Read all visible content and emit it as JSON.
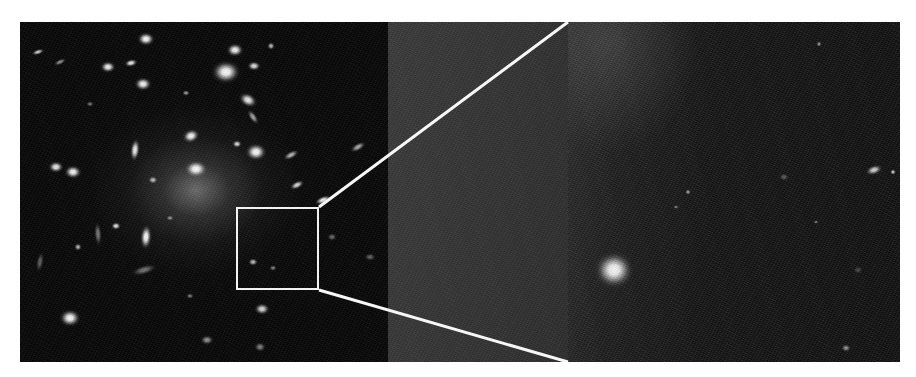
{
  "figure": {
    "kind": "astronomical-image-plate",
    "background_color": "#ffffff",
    "plate_color": "#050505",
    "panels": [
      {
        "id": "wide",
        "name": "wide-cluster-field",
        "description": "Wide-field view of a rich galaxy cluster dominated by a central bright elliptical galaxy with an extended diffuse halo",
        "x": 0,
        "y": 0,
        "width": 368,
        "height": 340,
        "mean_level": "#070707"
      },
      {
        "id": "mid",
        "name": "zoom-wedge-panel",
        "description": "Uniform mid-grey wedge panel bridging the survey box and the magnified cutout",
        "x": 368,
        "y": 0,
        "width": 180,
        "height": 340,
        "mean_level": "#343434"
      },
      {
        "id": "zoom",
        "name": "magnified-cutout-panel",
        "description": "Magnified cutout of the boxed region showing two faint circled sources, one bright saturated star and two galaxies at the right edge",
        "x": 548,
        "y": 0,
        "width": 332,
        "height": 340,
        "mean_level": "#131313"
      }
    ],
    "zoom_box": {
      "name": "survey-region-box",
      "x": 216,
      "y": 185,
      "width": 83,
      "height": 83,
      "stroke_color": "#f2f2f2",
      "stroke_width": 2
    },
    "guide_lines": {
      "name": "magnification-guide-lines",
      "stroke_color": "#f7f7f7",
      "stroke_width": 3,
      "lines": [
        {
          "x1": 299,
          "y1": 185,
          "x2": 548,
          "y2": 0
        },
        {
          "x1": 299,
          "y1": 268,
          "x2": 548,
          "y2": 340
        }
      ]
    },
    "markers": [
      {
        "name": "circled-source-upper",
        "cx": 725,
        "cy": 96,
        "r": 17,
        "stroke_color": "rgba(186,186,186,0.40)"
      },
      {
        "name": "circled-source-lower",
        "cx": 703,
        "cy": 233,
        "r": 17,
        "stroke_color": "rgba(186,186,186,0.40)"
      }
    ],
    "sources_wide": [
      {
        "cx": 18,
        "cy": 30,
        "rx": 7,
        "ry": 3,
        "rot": -18,
        "peak": 0.8
      },
      {
        "cx": 126,
        "cy": 17,
        "rx": 9,
        "ry": 7,
        "rot": 0,
        "peak": 1.0
      },
      {
        "cx": 111,
        "cy": 41,
        "rx": 7,
        "ry": 4,
        "rot": -12,
        "peak": 0.92
      },
      {
        "cx": 215,
        "cy": 28,
        "rx": 9,
        "ry": 7,
        "rot": 0,
        "peak": 0.96
      },
      {
        "cx": 206,
        "cy": 50,
        "rx": 15,
        "ry": 12,
        "rot": 0,
        "peak": 1.0
      },
      {
        "cx": 234,
        "cy": 44,
        "rx": 7,
        "ry": 5,
        "rot": 0,
        "peak": 0.88
      },
      {
        "cx": 251,
        "cy": 24,
        "rx": 4,
        "ry": 4,
        "rot": 0,
        "peak": 0.72
      },
      {
        "cx": 88,
        "cy": 45,
        "rx": 8,
        "ry": 6,
        "rot": 0,
        "peak": 0.95
      },
      {
        "cx": 123,
        "cy": 62,
        "rx": 9,
        "ry": 7,
        "rot": 0,
        "peak": 0.97
      },
      {
        "cx": 40,
        "cy": 40,
        "rx": 7,
        "ry": 3,
        "rot": -25,
        "peak": 0.55
      },
      {
        "cx": 166,
        "cy": 71,
        "rx": 4,
        "ry": 3,
        "rot": 0,
        "peak": 0.6
      },
      {
        "cx": 228,
        "cy": 78,
        "rx": 10,
        "ry": 7,
        "rot": 28,
        "peak": 0.92
      },
      {
        "cx": 233,
        "cy": 95,
        "rx": 9,
        "ry": 4,
        "rot": 55,
        "peak": 0.62
      },
      {
        "cx": 171,
        "cy": 114,
        "rx": 9,
        "ry": 7,
        "rot": -20,
        "peak": 0.98
      },
      {
        "cx": 115,
        "cy": 128,
        "rx": 5,
        "ry": 12,
        "rot": 6,
        "peak": 0.95
      },
      {
        "cx": 217,
        "cy": 122,
        "rx": 5,
        "ry": 4,
        "rot": 0,
        "peak": 0.85
      },
      {
        "cx": 236,
        "cy": 130,
        "rx": 11,
        "ry": 9,
        "rot": 0,
        "peak": 1.0
      },
      {
        "cx": 176,
        "cy": 147,
        "rx": 12,
        "ry": 9,
        "rot": 0,
        "peak": 1.0
      },
      {
        "cx": 36,
        "cy": 145,
        "rx": 8,
        "ry": 6,
        "rot": 0,
        "peak": 0.92
      },
      {
        "cx": 53,
        "cy": 150,
        "rx": 9,
        "ry": 7,
        "rot": 0,
        "peak": 0.97
      },
      {
        "cx": 133,
        "cy": 158,
        "rx": 5,
        "ry": 4,
        "rot": 0,
        "peak": 0.7
      },
      {
        "cx": 271,
        "cy": 133,
        "rx": 9,
        "ry": 4,
        "rot": -28,
        "peak": 0.7
      },
      {
        "cx": 277,
        "cy": 163,
        "rx": 8,
        "ry": 4,
        "rot": -26,
        "peak": 0.85
      },
      {
        "cx": 96,
        "cy": 204,
        "rx": 5,
        "ry": 4,
        "rot": 0,
        "peak": 0.9
      },
      {
        "cx": 78,
        "cy": 212,
        "rx": 4,
        "ry": 13,
        "rot": -4,
        "peak": 0.45
      },
      {
        "cx": 58,
        "cy": 225,
        "rx": 4,
        "ry": 4,
        "rot": 0,
        "peak": 0.7
      },
      {
        "cx": 126,
        "cy": 215,
        "rx": 6,
        "ry": 13,
        "rot": 4,
        "peak": 1.0
      },
      {
        "cx": 124,
        "cy": 248,
        "rx": 14,
        "ry": 5,
        "rot": -16,
        "peak": 0.42
      },
      {
        "cx": 50,
        "cy": 296,
        "rx": 11,
        "ry": 9,
        "rot": 0,
        "peak": 1.0
      },
      {
        "cx": 170,
        "cy": 274,
        "rx": 4,
        "ry": 3,
        "rot": 0,
        "peak": 0.45
      },
      {
        "cx": 242,
        "cy": 287,
        "rx": 8,
        "ry": 6,
        "rot": 0,
        "peak": 0.85
      },
      {
        "cx": 253,
        "cy": 246,
        "rx": 4,
        "ry": 3,
        "rot": 0,
        "peak": 0.48
      },
      {
        "cx": 187,
        "cy": 318,
        "rx": 7,
        "ry": 5,
        "rot": 0,
        "peak": 0.55
      },
      {
        "cx": 240,
        "cy": 325,
        "rx": 6,
        "ry": 5,
        "rot": 0,
        "peak": 0.48
      },
      {
        "cx": 20,
        "cy": 240,
        "rx": 4,
        "ry": 11,
        "rot": 10,
        "peak": 0.35
      },
      {
        "cx": 338,
        "cy": 125,
        "rx": 9,
        "ry": 4,
        "rot": -30,
        "peak": 0.66
      },
      {
        "cx": 303,
        "cy": 178,
        "rx": 9,
        "ry": 4,
        "rot": -22,
        "peak": 0.95
      },
      {
        "cx": 312,
        "cy": 215,
        "rx": 5,
        "ry": 4,
        "rot": 0,
        "peak": 0.4
      },
      {
        "cx": 350,
        "cy": 235,
        "rx": 6,
        "ry": 4,
        "rot": 0,
        "peak": 0.36
      },
      {
        "cx": 233,
        "cy": 240,
        "rx": 5,
        "ry": 4,
        "rot": 0,
        "peak": 0.72
      },
      {
        "cx": 70,
        "cy": 82,
        "rx": 4,
        "ry": 3,
        "rot": 0,
        "peak": 0.42
      },
      {
        "cx": 150,
        "cy": 196,
        "rx": 4,
        "ry": 3,
        "rot": 0,
        "peak": 0.5
      }
    ],
    "sources_zoom": [
      {
        "cx": 46,
        "cy": 248,
        "rx": 20,
        "ry": 19,
        "rot": 0,
        "peak": 1.0
      },
      {
        "cx": 342,
        "cy": 103,
        "rx": 10,
        "ry": 15,
        "rot": 8,
        "peak": 1.0
      },
      {
        "cx": 306,
        "cy": 148,
        "rx": 9,
        "ry": 5,
        "rot": -18,
        "peak": 0.82
      },
      {
        "cx": 325,
        "cy": 150,
        "rx": 3,
        "ry": 3,
        "rot": 0,
        "peak": 0.8
      },
      {
        "cx": 251,
        "cy": 22,
        "rx": 3,
        "ry": 3,
        "rot": 0,
        "peak": 0.55
      },
      {
        "cx": 120,
        "cy": 170,
        "rx": 3,
        "ry": 3,
        "rot": 0,
        "peak": 0.6
      },
      {
        "cx": 108,
        "cy": 185,
        "rx": 3,
        "ry": 2,
        "rot": 0,
        "peak": 0.45
      },
      {
        "cx": 248,
        "cy": 200,
        "rx": 3,
        "ry": 2,
        "rot": 0,
        "peak": 0.42
      },
      {
        "cx": 216,
        "cy": 155,
        "rx": 5,
        "ry": 4,
        "rot": 0,
        "peak": 0.3
      },
      {
        "cx": 278,
        "cy": 326,
        "rx": 5,
        "ry": 4,
        "rot": 0,
        "peak": 0.55
      },
      {
        "cx": 290,
        "cy": 248,
        "rx": 5,
        "ry": 4,
        "rot": 0,
        "peak": 0.22
      }
    ]
  }
}
